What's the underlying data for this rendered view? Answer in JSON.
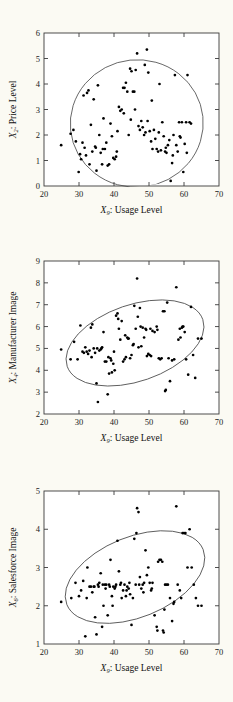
{
  "chart_data": [
    {
      "type": "scatter",
      "title": "",
      "xlabel": "X₉: Usage Level",
      "xlabel_var": "X",
      "xlabel_sub": "9",
      "xlabel_text": ": Usage Level",
      "ylabel": "X₂: Price Level",
      "ylabel_var": "X",
      "ylabel_sub": "2",
      "ylabel_text": ": Price Level",
      "xlim": [
        20,
        70
      ],
      "ylim": [
        0,
        6
      ],
      "xticks": [
        20,
        30,
        40,
        50,
        60,
        70
      ],
      "yticks": [
        0,
        1,
        2,
        3,
        4,
        5,
        6
      ],
      "grid": false,
      "legend": "none",
      "annotation": "95% confidence ellipse",
      "ellipse": {
        "cx": 46.5,
        "cy": 2.45,
        "rx": 19.0,
        "ry": 2.5,
        "angle": -6
      },
      "x": [
        24.9,
        27.6,
        28.4,
        29.1,
        29.9,
        30.3,
        30.6,
        31.0,
        31.3,
        31.6,
        32.0,
        32.3,
        32.7,
        33.0,
        33.4,
        33.8,
        34.2,
        34.6,
        35.0,
        35.4,
        35.8,
        36.2,
        36.6,
        37.0,
        37.4,
        37.8,
        38.2,
        38.6,
        39.0,
        39.4,
        39.8,
        40.2,
        40.6,
        41.0,
        41.4,
        41.8,
        42.2,
        42.6,
        43.0,
        43.4,
        43.8,
        44.2,
        44.6,
        45.0,
        45.4,
        45.8,
        46.2,
        46.6,
        47.0,
        47.4,
        47.8,
        48.2,
        48.6,
        49.0,
        49.4,
        49.8,
        50.2,
        50.6,
        51.0,
        51.4,
        51.8,
        52.2,
        52.6,
        53.0,
        53.4,
        53.8,
        54.2,
        54.6,
        55.0,
        55.4,
        55.8,
        56.2,
        56.6,
        57.0,
        57.4,
        57.8,
        58.2,
        58.6,
        59.0,
        59.4,
        59.8,
        60.2,
        60.6,
        61.0,
        61.6,
        62.0,
        44.8,
        46.0,
        48.8,
        49.6,
        34.8,
        36.8,
        40.8,
        42.8,
        50.8,
        52.8,
        54.8,
        56.8,
        58.8,
        60.8
      ],
      "y": [
        1.6,
        2.05,
        2.2,
        1.75,
        0.55,
        1.25,
        1.05,
        1.7,
        3.55,
        1.5,
        1.2,
        3.65,
        3.75,
        0.85,
        2.4,
        1.35,
        3.4,
        1.55,
        0.6,
        3.95,
        2.0,
        1.3,
        0.85,
        2.65,
        1.45,
        1.7,
        0.8,
        0.85,
        2.45,
        1.95,
        1.1,
        1.05,
        1.15,
        2.15,
        3.1,
        2.95,
        3.0,
        3.85,
        3.85,
        4.05,
        3.7,
        2.0,
        4.6,
        4.5,
        3.7,
        3.7,
        4.55,
        5.2,
        2.35,
        2.2,
        2.55,
        2.3,
        2.0,
        2.1,
        5.35,
        4.45,
        2.15,
        1.75,
        1.45,
        2.2,
        1.85,
        1.45,
        1.35,
        4.0,
        1.4,
        2.5,
        1.95,
        1.35,
        1.3,
        1.6,
        1.8,
        0.2,
        0.9,
        2.0,
        4.35,
        1.6,
        1.35,
        2.5,
        1.9,
        2.5,
        0.55,
        1.65,
        2.5,
        4.35,
        2.5,
        2.45,
        2.6,
        3.0,
        4.75,
        2.55,
        1.5,
        1.45,
        1.35,
        2.85,
        3.35,
        2.1,
        1.5,
        1.2,
        1.95,
        1.3
      ]
    },
    {
      "type": "scatter",
      "title": "",
      "xlabel": "X₉: Usage Level",
      "xlabel_var": "X",
      "xlabel_sub": "9",
      "xlabel_text": ": Usage Level",
      "ylabel": "X₄: Manufacturer Image",
      "ylabel_var": "X",
      "ylabel_sub": "4",
      "ylabel_text": ": Manufacturer Image",
      "xlim": [
        20,
        70
      ],
      "ylim": [
        2,
        9
      ],
      "xticks": [
        20,
        30,
        40,
        50,
        60,
        70
      ],
      "yticks": [
        2,
        3,
        4,
        5,
        6,
        7,
        8,
        9
      ],
      "grid": false,
      "legend": "none",
      "annotation": "95% confidence ellipse",
      "ellipse": {
        "cx": 46.0,
        "cy": 5.25,
        "rx": 20.5,
        "ry": 1.75,
        "angle": -19
      },
      "x": [
        24.9,
        27.6,
        28.6,
        29.6,
        30.4,
        31.0,
        31.4,
        31.8,
        32.2,
        32.6,
        33.0,
        33.4,
        33.8,
        34.2,
        34.6,
        35.0,
        35.4,
        35.8,
        36.2,
        36.6,
        37.0,
        37.4,
        37.8,
        38.2,
        38.6,
        39.0,
        39.4,
        39.8,
        40.2,
        40.6,
        41.0,
        41.4,
        41.8,
        42.2,
        42.6,
        43.0,
        43.4,
        43.8,
        44.2,
        44.6,
        45.0,
        45.4,
        45.8,
        46.2,
        46.6,
        47.0,
        47.4,
        47.8,
        48.2,
        48.6,
        49.0,
        49.4,
        49.8,
        50.2,
        50.6,
        51.0,
        51.6,
        52.2,
        52.8,
        53.2,
        53.6,
        54.0,
        54.4,
        54.8,
        55.2,
        55.6,
        56.0,
        56.6,
        57.2,
        57.8,
        58.4,
        59.0,
        59.4,
        59.8,
        60.2,
        60.6,
        61.2,
        62.0,
        62.6,
        63.2,
        64.0,
        65.0,
        35.2,
        38.4,
        40.0,
        43.2,
        44.0,
        46.8,
        47.6,
        52.4,
        33.6,
        36.4,
        39.2,
        41.2,
        45.6,
        49.2,
        50.4,
        54.6,
        58.8,
        59.6
      ],
      "y": [
        4.95,
        4.5,
        5.3,
        4.5,
        6.05,
        4.85,
        4.8,
        5.05,
        4.85,
        4.75,
        4.9,
        5.95,
        6.1,
        5.0,
        4.8,
        3.4,
        2.55,
        4.9,
        4.95,
        5.05,
        5.75,
        4.4,
        4.4,
        2.9,
        3.85,
        4.55,
        3.9,
        4.3,
        4.0,
        6.5,
        6.6,
        5.9,
        5.4,
        6.25,
        4.4,
        4.5,
        4.6,
        5.5,
        5.45,
        4.55,
        4.7,
        5.15,
        6.95,
        5.9,
        8.2,
        5.05,
        6.85,
        5.1,
        5.95,
        5.5,
        5.9,
        4.65,
        4.75,
        4.7,
        4.65,
        5.8,
        5.75,
        6.0,
        4.55,
        4.5,
        4.55,
        6.7,
        6.7,
        3.1,
        7.1,
        4.55,
        3.5,
        4.45,
        4.5,
        7.8,
        5.4,
        5.5,
        5.95,
        6.0,
        5.75,
        4.5,
        3.8,
        6.9,
        4.7,
        3.65,
        5.45,
        5.45,
        5.0,
        4.6,
        4.85,
        5.6,
        5.45,
        6.45,
        6.0,
        5.85,
        4.6,
        5.0,
        4.45,
        6.35,
        5.2,
        5.85,
        5.9,
        3.05,
        5.9,
        6.0
      ]
    },
    {
      "type": "scatter",
      "title": "",
      "xlabel": "X₉: Usage Level",
      "xlabel_var": "X",
      "xlabel_sub": "9",
      "xlabel_text": ": Usage Level",
      "ylabel": "X₆: Salesforce Image",
      "ylabel_var": "X",
      "ylabel_sub": "6",
      "ylabel_text": ": Salesforce Image",
      "xlim": [
        20,
        70
      ],
      "ylim": [
        1,
        5
      ],
      "xticks": [
        20,
        30,
        40,
        50,
        60,
        70
      ],
      "yticks": [
        1,
        2,
        3,
        4,
        5
      ],
      "grid": false,
      "legend": "none",
      "annotation": "95% confidence ellipse",
      "ellipse": {
        "cx": 46.0,
        "cy": 2.75,
        "rx": 21.0,
        "ry": 1.05,
        "angle": -22
      },
      "x": [
        24.9,
        27.8,
        29.0,
        30.0,
        30.6,
        31.2,
        31.8,
        32.4,
        33.0,
        33.4,
        33.8,
        34.2,
        34.6,
        35.0,
        35.4,
        35.8,
        36.2,
        36.6,
        37.0,
        37.4,
        37.8,
        38.2,
        38.6,
        39.0,
        39.4,
        39.8,
        40.2,
        40.6,
        41.0,
        41.4,
        41.8,
        42.2,
        42.6,
        43.0,
        43.4,
        43.8,
        44.2,
        44.6,
        45.0,
        45.4,
        45.8,
        46.2,
        46.6,
        47.0,
        47.4,
        47.8,
        48.2,
        48.6,
        49.0,
        49.4,
        49.8,
        50.2,
        50.6,
        51.0,
        51.6,
        52.2,
        52.6,
        53.0,
        53.4,
        53.8,
        54.0,
        54.2,
        54.6,
        55.0,
        55.4,
        56.0,
        56.6,
        57.2,
        57.8,
        58.2,
        58.8,
        59.2,
        59.6,
        60.0,
        60.4,
        61.0,
        61.6,
        62.2,
        62.8,
        63.4,
        64.0,
        65.0,
        35.6,
        36.8,
        38.8,
        40.4,
        42.0,
        43.6,
        46.4,
        48.4,
        32.2,
        34.4,
        37.6,
        39.6,
        44.4,
        47.2,
        50.8,
        52.4,
        54.4,
        57.0
      ],
      "y": [
        2.1,
        2.2,
        2.6,
        2.25,
        2.4,
        2.65,
        1.2,
        3.0,
        2.5,
        2.5,
        2.35,
        2.5,
        1.7,
        1.25,
        2.55,
        2.6,
        2.85,
        1.45,
        2.0,
        2.55,
        2.55,
        1.75,
        2.55,
        3.2,
        2.25,
        2.5,
        2.45,
        2.55,
        3.7,
        2.9,
        2.55,
        2.2,
        2.4,
        2.55,
        2.25,
        2.5,
        2.45,
        2.3,
        1.5,
        2.2,
        3.75,
        2.55,
        4.55,
        4.45,
        2.75,
        2.45,
        2.55,
        2.6,
        3.45,
        2.8,
        3.0,
        2.6,
        2.4,
        2.6,
        1.75,
        1.45,
        3.15,
        3.2,
        3.2,
        3.15,
        1.35,
        1.3,
        2.55,
        2.55,
        2.55,
        2.2,
        1.6,
        2.1,
        4.6,
        2.55,
        2.4,
        2.2,
        3.9,
        3.9,
        3.9,
        3.0,
        4.0,
        3.0,
        2.55,
        2.2,
        2.0,
        2.0,
        2.5,
        2.55,
        2.5,
        2.5,
        2.6,
        2.4,
        3.9,
        2.35,
        2.2,
        2.5,
        2.45,
        2.0,
        2.6,
        2.55,
        2.45,
        1.35,
        1.9,
        2.05
      ]
    }
  ],
  "style": {
    "background": "#fbfaf3",
    "plot_background": "#ffffff",
    "point_color": "#000000",
    "frame_color": "#3a3a3a",
    "ellipse_color": "#4a4a4a"
  }
}
